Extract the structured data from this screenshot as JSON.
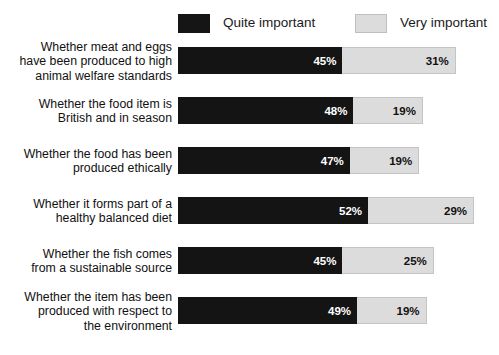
{
  "legend": {
    "position": "top",
    "entries": [
      {
        "label": "Quite important",
        "swatch": "dark-swatch",
        "color": "#141414"
      },
      {
        "label": "Very important",
        "swatch": "light-swatch",
        "color": "#dcdcdc"
      }
    ]
  },
  "chart_data": {
    "type": "bar",
    "orientation": "horizontal",
    "stacked": true,
    "title": "",
    "subtitle": "",
    "xlabel": "",
    "ylabel": "",
    "xlim": [
      0,
      100
    ],
    "grid": false,
    "legend_position": "top",
    "value_suffix": "%",
    "categories": [
      "Whether meat and eggs\nhave been produced to high\nanimal welfare standards",
      "Whether the food item is\nBritish and in season",
      "Whether the food has been\nproduced ethically",
      "Whether it forms part of a\nhealthy balanced diet",
      "Whether the fish comes\nfrom a sustainable source",
      "Whether the item has been\nproduced with respect to\nthe environment"
    ],
    "series": [
      {
        "name": "Quite important",
        "color": "#141414",
        "values": [
          45,
          48,
          47,
          52,
          45,
          49
        ],
        "labels": [
          "45%",
          "48%",
          "47%",
          "52%",
          "45%",
          "49%"
        ]
      },
      {
        "name": "Very important",
        "color": "#dcdcdc",
        "values": [
          31,
          19,
          19,
          29,
          25,
          19
        ],
        "labels": [
          "31%",
          "19%",
          "19%",
          "29%",
          "25%",
          "19%"
        ]
      }
    ],
    "totals": [
      76,
      67,
      66,
      81,
      70,
      68
    ]
  }
}
